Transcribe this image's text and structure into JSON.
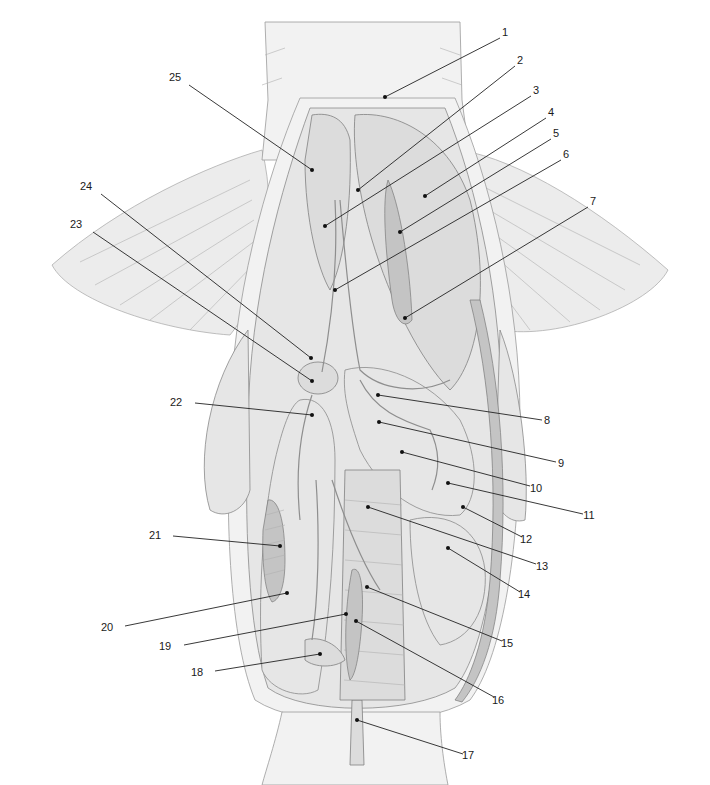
{
  "figure": {
    "type": "anatomical-illustration",
    "background": "#ffffff",
    "line_color": "#222222"
  },
  "labels": [
    {
      "n": "1",
      "text_x": 505,
      "text_y": 36,
      "pt_x": 385,
      "pt_y": 97,
      "line_from_x": 500,
      "line_from_y": 38
    },
    {
      "n": "2",
      "text_x": 520,
      "text_y": 64,
      "pt_x": 358,
      "pt_y": 190,
      "line_from_x": 515,
      "line_from_y": 66
    },
    {
      "n": "3",
      "text_x": 536,
      "text_y": 94,
      "pt_x": 325,
      "pt_y": 226,
      "line_from_x": 531,
      "line_from_y": 96
    },
    {
      "n": "4",
      "text_x": 551,
      "text_y": 116,
      "pt_x": 425,
      "pt_y": 196,
      "line_from_x": 546,
      "line_from_y": 118
    },
    {
      "n": "5",
      "text_x": 556,
      "text_y": 137,
      "pt_x": 400,
      "pt_y": 232,
      "line_from_x": 551,
      "line_from_y": 139
    },
    {
      "n": "6",
      "text_x": 566,
      "text_y": 158,
      "pt_x": 335,
      "pt_y": 290,
      "line_from_x": 561,
      "line_from_y": 160
    },
    {
      "n": "7",
      "text_x": 593,
      "text_y": 205,
      "pt_x": 405,
      "pt_y": 318,
      "line_from_x": 588,
      "line_from_y": 207
    },
    {
      "n": "8",
      "text_x": 547,
      "text_y": 424,
      "pt_x": 378,
      "pt_y": 395,
      "line_from_x": 542,
      "line_from_y": 420
    },
    {
      "n": "9",
      "text_x": 561,
      "text_y": 467,
      "pt_x": 379,
      "pt_y": 422,
      "line_from_x": 556,
      "line_from_y": 462
    },
    {
      "n": "10",
      "text_x": 536,
      "text_y": 492,
      "pt_x": 402,
      "pt_y": 452,
      "line_from_x": 530,
      "line_from_y": 486
    },
    {
      "n": "11",
      "text_x": 589,
      "text_y": 519,
      "pt_x": 448,
      "pt_y": 483,
      "line_from_x": 583,
      "line_from_y": 514
    },
    {
      "n": "12",
      "text_x": 526,
      "text_y": 543,
      "pt_x": 463,
      "pt_y": 507,
      "line_from_x": 522,
      "line_from_y": 537
    },
    {
      "n": "13",
      "text_x": 542,
      "text_y": 570,
      "pt_x": 368,
      "pt_y": 507,
      "line_from_x": 536,
      "line_from_y": 564
    },
    {
      "n": "14",
      "text_x": 524,
      "text_y": 598,
      "pt_x": 448,
      "pt_y": 548,
      "line_from_x": 520,
      "line_from_y": 592
    },
    {
      "n": "15",
      "text_x": 507,
      "text_y": 647,
      "pt_x": 367,
      "pt_y": 587,
      "line_from_x": 502,
      "line_from_y": 641
    },
    {
      "n": "16",
      "text_x": 498,
      "text_y": 704,
      "pt_x": 356,
      "pt_y": 621,
      "line_from_x": 494,
      "line_from_y": 697
    },
    {
      "n": "17",
      "text_x": 468,
      "text_y": 759,
      "pt_x": 357,
      "pt_y": 720,
      "line_from_x": 463,
      "line_from_y": 754
    },
    {
      "n": "18",
      "text_x": 197,
      "text_y": 676,
      "pt_x": 320,
      "pt_y": 654,
      "line_from_x": 215,
      "line_from_y": 671
    },
    {
      "n": "19",
      "text_x": 165,
      "text_y": 650,
      "pt_x": 346,
      "pt_y": 614,
      "line_from_x": 184,
      "line_from_y": 645
    },
    {
      "n": "20",
      "text_x": 107,
      "text_y": 631,
      "pt_x": 287,
      "pt_y": 593,
      "line_from_x": 125,
      "line_from_y": 626
    },
    {
      "n": "21",
      "text_x": 155,
      "text_y": 539,
      "pt_x": 280,
      "pt_y": 546,
      "line_from_x": 173,
      "line_from_y": 536
    },
    {
      "n": "22",
      "text_x": 176,
      "text_y": 406,
      "pt_x": 312,
      "pt_y": 415,
      "line_from_x": 195,
      "line_from_y": 403
    },
    {
      "n": "23",
      "text_x": 76,
      "text_y": 228,
      "pt_x": 312,
      "pt_y": 381,
      "line_from_x": 93,
      "line_from_y": 232
    },
    {
      "n": "24",
      "text_x": 86,
      "text_y": 190,
      "pt_x": 311,
      "pt_y": 358,
      "line_from_x": 101,
      "line_from_y": 194
    },
    {
      "n": "25",
      "text_x": 175,
      "text_y": 81,
      "pt_x": 312,
      "pt_y": 170,
      "line_from_x": 189,
      "line_from_y": 85
    }
  ]
}
